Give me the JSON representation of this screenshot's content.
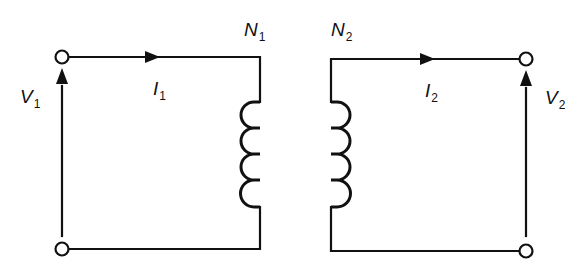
{
  "diagram": {
    "type": "ideal-transformer-circuit",
    "primary": {
      "voltage_label": {
        "main": "V",
        "sub": "1"
      },
      "current_label": {
        "main": "I",
        "sub": "1"
      },
      "turns_label": {
        "main": "N",
        "sub": "1"
      },
      "coil_loops": 4
    },
    "secondary": {
      "voltage_label": {
        "main": "V",
        "sub": "2"
      },
      "current_label": {
        "main": "I",
        "sub": "2"
      },
      "turns_label": {
        "main": "N",
        "sub": "2"
      },
      "coil_loops": 4
    },
    "colors": {
      "line": "#111111",
      "background": "#ffffff"
    }
  }
}
